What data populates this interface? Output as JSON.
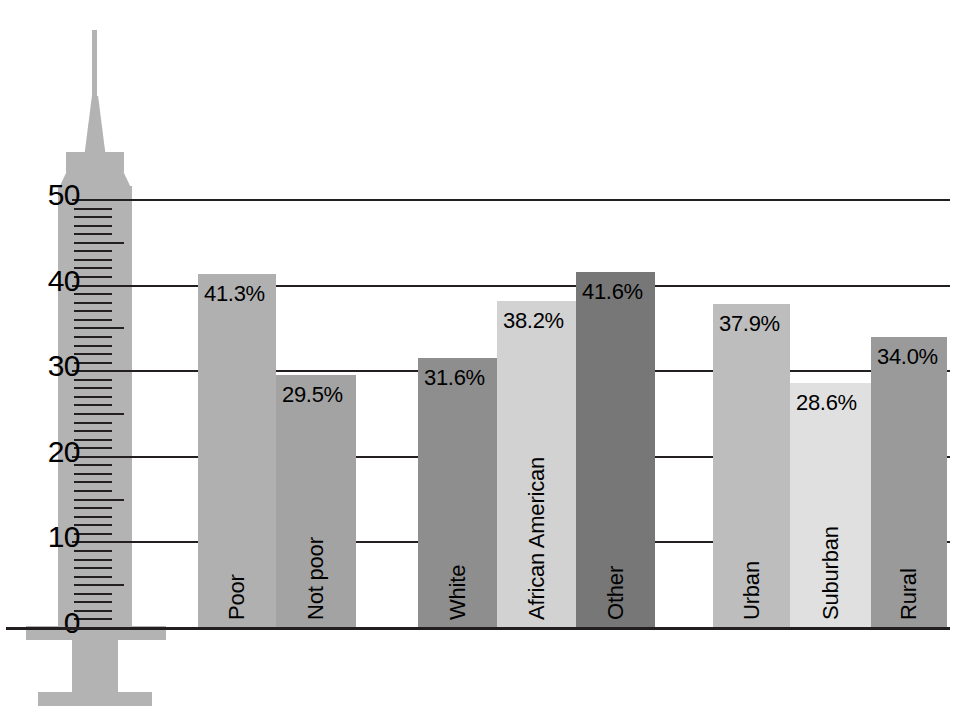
{
  "chart_data": {
    "type": "bar",
    "title": "",
    "subtitle": "",
    "xlabel": "",
    "ylabel": "",
    "ylim": [
      0,
      50
    ],
    "ytick_labels": [
      "0",
      "10",
      "20",
      "30",
      "40",
      "50"
    ],
    "ytick_values": [
      0,
      10,
      20,
      30,
      40,
      50
    ],
    "grid": true,
    "legend": "none",
    "value_suffix": "%",
    "axis_style": "syringe",
    "groups": [
      {
        "name": "income",
        "bars": [
          {
            "label": "Poor",
            "value": 41.3,
            "value_label": "41.3%",
            "color": "#b0b0b0"
          },
          {
            "label": "Not poor",
            "value": 29.5,
            "value_label": "29.5%",
            "color": "#a3a3a3"
          }
        ]
      },
      {
        "name": "race",
        "bars": [
          {
            "label": "White",
            "value": 31.6,
            "value_label": "31.6%",
            "color": "#8e8e8e"
          },
          {
            "label": "African American",
            "value": 38.2,
            "value_label": "38.2%",
            "color": "#d2d2d2"
          },
          {
            "label": "Other",
            "value": 41.6,
            "value_label": "41.6%",
            "color": "#777777"
          }
        ]
      },
      {
        "name": "residence",
        "bars": [
          {
            "label": "Urban",
            "value": 37.9,
            "value_label": "37.9%",
            "color": "#bdbdbd"
          },
          {
            "label": "Suburban",
            "value": 28.6,
            "value_label": "28.6%",
            "color": "#e0e0e0"
          },
          {
            "label": "Rural",
            "value": 34.0,
            "value_label": "34.0%",
            "color": "#9a9a9a"
          }
        ]
      }
    ],
    "categories": [
      "Poor",
      "Not poor",
      "White",
      "African American",
      "Other",
      "Urban",
      "Suburban",
      "Rural"
    ],
    "values": [
      41.3,
      29.5,
      31.6,
      38.2,
      41.6,
      37.9,
      28.6,
      34.0
    ]
  },
  "axis": {
    "syringe_color": "#b3b3b3",
    "line_color": "#231f20",
    "parts": [
      "syringe-needle",
      "syringe-hub",
      "syringe-flange-top",
      "syringe-shoulder",
      "syringe-barrel",
      "syringe-plunger-flange",
      "syringe-plunger-rod",
      "syringe-plunger-thumbrest"
    ]
  }
}
